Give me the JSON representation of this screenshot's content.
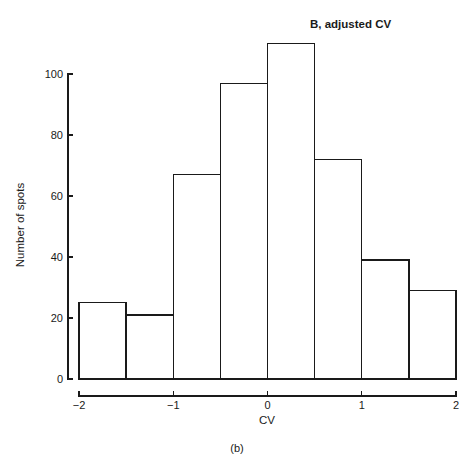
{
  "figure": {
    "caption": "(b)"
  },
  "chart_data": {
    "type": "bar",
    "title": "B, adjusted CV",
    "xlabel": "CV",
    "ylabel": "Number of spots",
    "categories": [
      "-2 to -1.5",
      "-1.5 to -1",
      "-1 to -0.5",
      "-0.5 to 0",
      "0 to 0.5",
      "0.5 to 1",
      "1 to 1.5",
      "1.5 to 2"
    ],
    "bin_edges": [
      -2,
      -1.5,
      -1,
      -0.5,
      0,
      0.5,
      1,
      1.5,
      2
    ],
    "values": [
      25,
      21,
      67,
      97,
      110,
      72,
      39,
      29
    ],
    "xlim": [
      -2,
      2
    ],
    "ylim": [
      0,
      110
    ],
    "xticks": [
      -2,
      -1,
      0,
      1,
      2
    ],
    "xtick_labels": [
      "−2",
      "−1",
      "0",
      "1",
      "2"
    ],
    "yticks": [
      0,
      20,
      40,
      60,
      80,
      100
    ],
    "ytick_labels": [
      "0",
      "20",
      "40",
      "60",
      "80",
      "100"
    ],
    "grid": false,
    "legend": null,
    "bar_fill_color": "#ffffff",
    "bar_stroke_color": "#1a1a1a"
  }
}
